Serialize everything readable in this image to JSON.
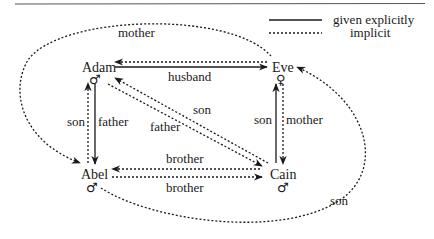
{
  "legend": {
    "explicit_label": "given explicitly",
    "implicit_label": "implicit"
  },
  "nodes": {
    "adam": {
      "name": "Adam",
      "gender_symbol": "♂"
    },
    "eve": {
      "name": "Eve",
      "gender_symbol": "♀"
    },
    "abel": {
      "name": "Abel",
      "gender_symbol": "♂"
    },
    "cain": {
      "name": "Cain",
      "gender_symbol": "♂"
    }
  },
  "edges": {
    "adam_eve_husband": {
      "label": "husband",
      "style": "explicit",
      "from": "Adam",
      "to": "Eve"
    },
    "eve_adam_implicit": {
      "label": "",
      "style": "implicit",
      "from": "Eve",
      "to": "Adam"
    },
    "adam_abel_father": {
      "label": "father",
      "style": "explicit",
      "from": "Adam",
      "to": "Abel"
    },
    "abel_adam_son": {
      "label": "son",
      "style": "implicit",
      "from": "Abel",
      "to": "Adam"
    },
    "eve_cain_mother": {
      "label": "mother",
      "style": "implicit",
      "from": "Eve",
      "to": "Cain"
    },
    "cain_eve_son": {
      "label": "son",
      "style": "explicit",
      "from": "Cain",
      "to": "Eve"
    },
    "adam_cain_father": {
      "label": "father",
      "style": "implicit",
      "from": "Adam",
      "to": "Cain"
    },
    "cain_adam_son": {
      "label": "son",
      "style": "implicit",
      "from": "Cain",
      "to": "Adam"
    },
    "cain_abel_brother": {
      "label": "brother",
      "style": "implicit",
      "from": "Cain",
      "to": "Abel"
    },
    "abel_cain_brother": {
      "label": "brother",
      "style": "implicit",
      "from": "Abel",
      "to": "Cain"
    },
    "eve_abel_mother": {
      "label": "mother",
      "style": "implicit",
      "from": "Eve",
      "to": "Abel"
    },
    "abel_eve_son": {
      "label": "son",
      "style": "implicit",
      "from": "Abel",
      "to": "Eve"
    }
  },
  "colors": {
    "ink": "#1a1a1a",
    "background": "#ffffff",
    "rule": "#555555"
  }
}
